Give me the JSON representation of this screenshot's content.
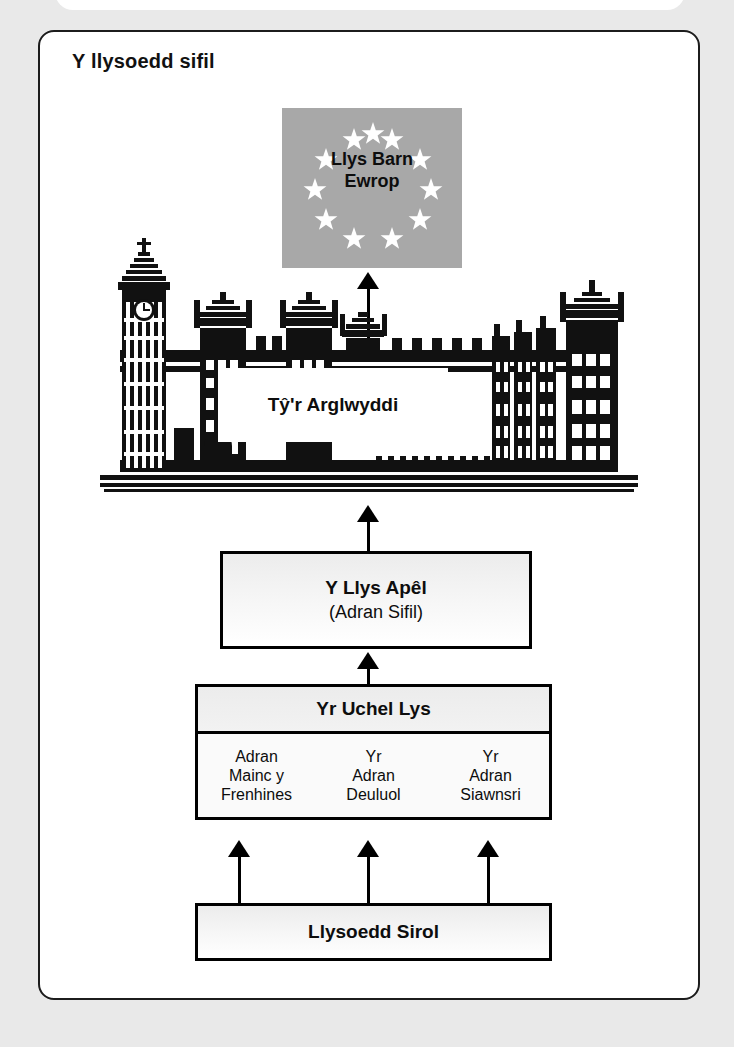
{
  "page": {
    "title": "Y llysoedd sifil"
  },
  "nodes": {
    "european_court": {
      "label_line1": "Llys Barn",
      "label_line2": "Ewrop",
      "star_count": 12,
      "flag_color": "#a8a8a8",
      "star_color": "#ffffff"
    },
    "house_of_lords": {
      "label": "Tŷ'r Arglwyddi"
    },
    "court_of_appeal": {
      "title": "Y Llys Apêl",
      "subtitle": "(Adran Sifil)"
    },
    "high_court": {
      "title": "Yr Uchel Lys",
      "divisions": [
        {
          "lines": [
            "Adran",
            "Mainc y",
            "Frenhines"
          ]
        },
        {
          "lines": [
            "Yr",
            "Adran",
            "Deuluol"
          ]
        },
        {
          "lines": [
            "Yr",
            "Adran",
            "Siawnsri"
          ]
        }
      ]
    },
    "county_courts": {
      "label": "Llysoedd Sirol"
    }
  },
  "flow": {
    "direction": "upwards",
    "connections": [
      {
        "from": "county_courts",
        "to": "high_court",
        "count": 3
      },
      {
        "from": "high_court",
        "to": "court_of_appeal",
        "count": 1
      },
      {
        "from": "court_of_appeal",
        "to": "house_of_lords",
        "count": 1
      },
      {
        "from": "house_of_lords",
        "to": "european_court",
        "count": 1
      }
    ]
  },
  "colors": {
    "ink": "#000000",
    "box_fill": "#ececec",
    "flag": "#a8a8a8",
    "page_background": "#e9e9e9"
  }
}
